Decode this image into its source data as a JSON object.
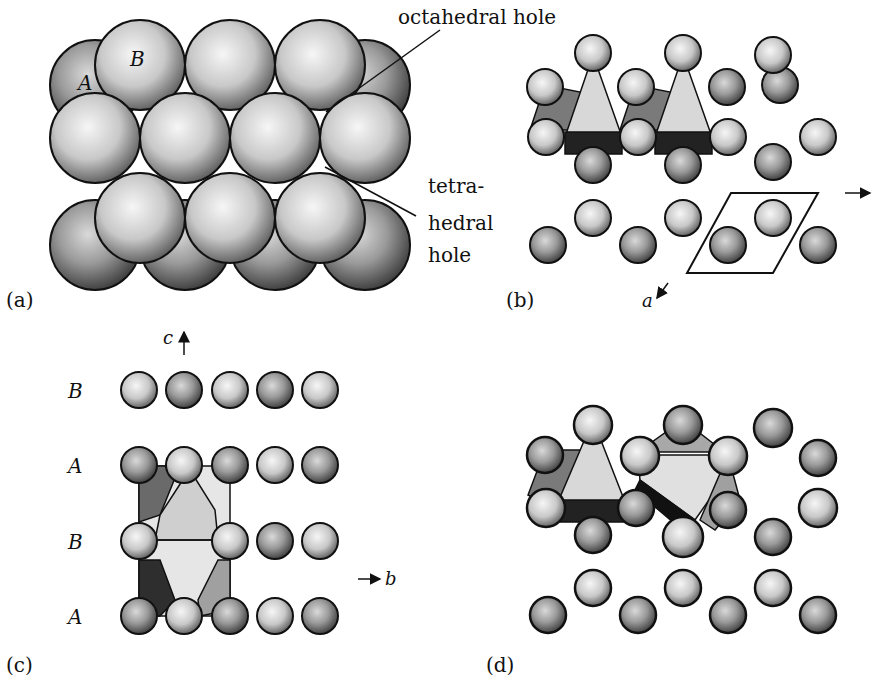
{
  "figure": {
    "panels": {
      "a": {
        "label": "(a)",
        "layer_labels": {
          "top": "B",
          "bottom": "A"
        },
        "annotations": {
          "octahedral": "octahedral hole",
          "tetra_1": "tetra-",
          "tetra_2": "hedral",
          "tetra_3": "hole"
        }
      },
      "b": {
        "label": "(b)",
        "axis_a": "a",
        "axis_b": "b"
      },
      "c": {
        "label": "(c)",
        "axis_c": "c",
        "axis_b": "b",
        "layers": [
          "B",
          "A",
          "B",
          "A"
        ]
      },
      "d": {
        "label": "(d)"
      }
    },
    "colors": {
      "sphere_light": "#f4f4f4",
      "sphere_dark": "#555555",
      "poly_light": "#d8d8d8",
      "poly_mid": "#9a9a9a",
      "poly_dark": "#2a2a2a",
      "outline": "#111111"
    }
  }
}
